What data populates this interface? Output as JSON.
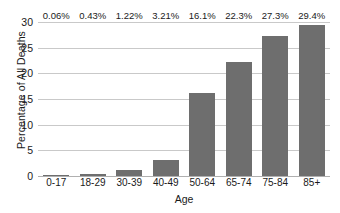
{
  "chart_data": {
    "type": "bar",
    "title": "",
    "subtitle": "",
    "xlabel": "Age",
    "ylabel": "Percentage of All Deaths",
    "categories": [
      "0-17",
      "18-29",
      "30-39",
      "40-49",
      "50-64",
      "65-74",
      "75-84",
      "85+"
    ],
    "values": [
      0.06,
      0.43,
      1.22,
      3.21,
      16.1,
      22.3,
      27.3,
      29.4
    ],
    "value_labels": [
      "0.06%",
      "0.43%",
      "1.22%",
      "3.21%",
      "16.1%",
      "22.3%",
      "27.3%",
      "29.4%"
    ],
    "series": [
      {
        "name": "Percentage of All Deaths",
        "values": [
          0.06,
          0.43,
          1.22,
          3.21,
          16.1,
          22.3,
          27.3,
          29.4
        ]
      }
    ],
    "ylim": [
      0,
      30
    ],
    "yticks": [
      0,
      5,
      10,
      15,
      20,
      25,
      30
    ],
    "ytick_labels": [
      "0",
      "5",
      "10",
      "15",
      "20",
      "25",
      "30"
    ],
    "xlim_categories": 8,
    "grid": "horizontal",
    "legend": "none",
    "bar_color": "#6e6e6e",
    "gridline_color": "#c9c9c9",
    "axis_color": "#b0b0b0",
    "background_color": "#ffffff",
    "text_color": "#1a1a1a"
  }
}
